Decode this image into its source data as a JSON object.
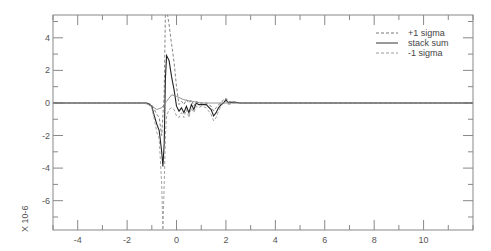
{
  "chart_data": {
    "type": "line",
    "title": "",
    "xlabel": "",
    "ylabel": "",
    "y_scale_label": "X 10-6",
    "xlim": [
      -5.0,
      12.0
    ],
    "ylim": [
      -7.8,
      5.4
    ],
    "grid": false,
    "legend_position": "upper right",
    "x_ticks": [
      -4,
      -2,
      0,
      2,
      4,
      6,
      8,
      10
    ],
    "x_tick_labels": [
      "-4",
      "-2",
      "0",
      "2",
      "4",
      "6",
      "8",
      "10"
    ],
    "y_ticks": [
      -6,
      -4,
      -2,
      0,
      2,
      4
    ],
    "y_tick_labels": [
      "-6",
      "-4",
      "-2",
      "0",
      "2",
      "4"
    ],
    "series": [
      {
        "name": "+1 sigma",
        "style": "dashed",
        "color": "#777777",
        "x": [
          -5.0,
          -1.2,
          -1.0,
          -0.9,
          -0.8,
          -0.7,
          -0.6,
          -0.5,
          -0.45,
          -0.4,
          -0.3,
          -0.2,
          -0.1,
          0.0,
          0.1,
          0.2,
          0.3,
          0.4,
          0.5,
          0.6,
          0.7,
          0.8,
          0.9,
          1.0,
          1.2,
          1.4,
          1.5,
          1.6,
          1.7,
          1.8,
          1.9,
          2.0,
          2.1,
          2.3,
          2.6,
          3.0,
          12.0
        ],
        "values": [
          0.0,
          0.0,
          -0.1,
          -0.4,
          -0.7,
          -0.9,
          -2.0,
          0.5,
          5.6,
          5.8,
          4.8,
          3.6,
          2.5,
          1.0,
          -0.1,
          0.1,
          -0.1,
          0.2,
          0.0,
          0.2,
          -0.2,
          0.1,
          0.0,
          0.0,
          0.0,
          -0.2,
          -0.5,
          -0.3,
          -0.1,
          0.0,
          0.2,
          0.3,
          0.1,
          0.05,
          0.0,
          0.0,
          0.0
        ]
      },
      {
        "name": "stack sum",
        "style": "solid",
        "color": "#222222",
        "x": [
          -5.0,
          -1.2,
          -1.0,
          -0.9,
          -0.8,
          -0.7,
          -0.6,
          -0.55,
          -0.5,
          -0.45,
          -0.4,
          -0.3,
          -0.2,
          -0.1,
          0.0,
          0.1,
          0.2,
          0.3,
          0.4,
          0.5,
          0.6,
          0.7,
          0.8,
          0.9,
          1.0,
          1.2,
          1.4,
          1.5,
          1.6,
          1.7,
          1.8,
          1.9,
          2.0,
          2.1,
          2.3,
          2.6,
          3.0,
          12.0
        ],
        "values": [
          0.0,
          0.0,
          -0.2,
          -0.8,
          -1.3,
          -1.7,
          -3.0,
          -3.9,
          -2.5,
          1.5,
          2.9,
          2.6,
          1.6,
          0.8,
          -0.2,
          -0.5,
          -0.3,
          -0.6,
          -0.2,
          -0.6,
          -0.1,
          -0.4,
          0.0,
          -0.1,
          -0.1,
          -0.1,
          -0.4,
          -0.8,
          -0.6,
          -0.3,
          -0.1,
          0.0,
          0.2,
          0.0,
          0.05,
          0.0,
          0.0,
          0.0
        ]
      },
      {
        "name": "-1 sigma",
        "style": "dashed",
        "color": "#999999",
        "x": [
          -5.0,
          -1.2,
          -1.0,
          -0.9,
          -0.8,
          -0.7,
          -0.6,
          -0.55,
          -0.5,
          -0.45,
          -0.4,
          -0.3,
          -0.2,
          -0.1,
          0.0,
          0.1,
          0.2,
          0.3,
          0.4,
          0.5,
          0.6,
          0.7,
          0.8,
          0.9,
          1.0,
          1.2,
          1.4,
          1.5,
          1.6,
          1.7,
          1.8,
          1.9,
          2.0,
          2.1,
          2.3,
          2.6,
          3.0,
          12.0
        ],
        "values": [
          0.0,
          0.0,
          -0.3,
          -1.0,
          -1.8,
          -2.2,
          -5.0,
          -7.8,
          -5.0,
          -2.0,
          -0.8,
          -0.4,
          -0.3,
          -0.4,
          -0.8,
          -0.9,
          -0.6,
          -0.9,
          -0.4,
          -0.9,
          -0.3,
          -0.6,
          -0.2,
          -0.3,
          -0.2,
          -0.3,
          -0.7,
          -1.1,
          -0.9,
          -0.5,
          -0.2,
          0.0,
          0.1,
          -0.1,
          0.0,
          0.0,
          0.0,
          0.0
        ]
      },
      {
        "name": "reference",
        "style": "solid-thin",
        "color": "#888888",
        "x": [
          -5.0,
          -1.5,
          -1.2,
          -1.0,
          -0.8,
          -0.6,
          -0.4,
          -0.2,
          0.0,
          0.3,
          0.6,
          1.0,
          2.0,
          12.0
        ],
        "values": [
          0.0,
          0.0,
          -0.05,
          -0.2,
          -0.4,
          -0.3,
          0.1,
          0.5,
          0.4,
          0.2,
          0.1,
          0.0,
          0.0,
          0.0
        ]
      }
    ]
  },
  "legend": {
    "items": [
      {
        "label": "+1 sigma"
      },
      {
        "label": "stack sum"
      },
      {
        "label": "-1 sigma"
      }
    ]
  },
  "axes": {
    "y_scale_label": "X 10-6"
  }
}
